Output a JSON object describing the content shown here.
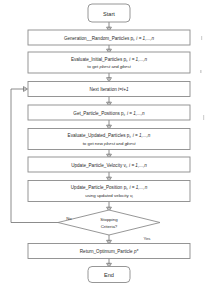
{
  "diagram": {
    "type": "flowchart",
    "orientation": "top-to-bottom",
    "colors": {
      "node_fill": "#ffffff",
      "node_stroke": "#8b8b8b",
      "line": "#6f6f6f",
      "text": "#2b2b2b",
      "background": "#ffffff"
    },
    "nodes": [
      {
        "id": "start",
        "shape": "terminator",
        "label": "Start",
        "line1": "Start",
        "line2": ""
      },
      {
        "id": "generate",
        "shape": "process",
        "label": "Generation__Random_Particles p, i = 1,...,n",
        "line1": "Generation__Random_Particles p",
        "line1_sub": "i",
        "line1_tail": ", i = 1,...,n",
        "line2": ""
      },
      {
        "id": "evaluate-initial",
        "shape": "process",
        "label": "Evaluate_Initial_Particles p, i = 1,...,n to get pbest and gbest",
        "line1": "Evaluate_Initial_Particles p",
        "line1_sub": "i",
        "line1_tail": ", i = 1,...,n",
        "line2_a": "to get ",
        "line2_b": "pbest",
        "line2_c": " and ",
        "line2_d": "gbest"
      },
      {
        "id": "next-iteration",
        "shape": "process",
        "label": "Next Iteration t=t+1",
        "line1": "Next Iteration ",
        "line1_tail": "t=t+1",
        "line2": ""
      },
      {
        "id": "get-positions",
        "shape": "process",
        "label": "Get_Particle_Positions p, i = 1,...,n",
        "line1": "Get_Particle_Positions p",
        "line1_sub": "i",
        "line1_tail": ", i = 1,...,n",
        "line2": ""
      },
      {
        "id": "evaluate-updated",
        "shape": "process",
        "label": "Evaluate_Updated_Particles p, i = 1,...,n to get new pbest and gbest",
        "line1": "Evaluate_Updated_Particles p",
        "line1_sub": "i",
        "line1_tail": ", i = 1,...,n",
        "line2_a": "to get new ",
        "line2_b": "pbest",
        "line2_c": " and ",
        "line2_d": "gbest"
      },
      {
        "id": "update-velocity",
        "shape": "process",
        "label": "Update_Particle_Velocity v, i = 1,...,n",
        "line1": "Update_Particle_Velocity v",
        "line1_sub": "i",
        "line1_tail": ", i = 1,...,n",
        "line2": ""
      },
      {
        "id": "update-position",
        "shape": "process",
        "label": "Update_Particle_Position p, i = 1,...,n using updated velocity v",
        "line1": "Update_Particle_Position p",
        "line1_sub": "i",
        "line1_tail": ", i = 1,...,n",
        "line2_a": "using updated velocity ",
        "line2_b": "v",
        "line2_sub": "i"
      },
      {
        "id": "stopping-criteria",
        "shape": "decision",
        "label": "Stopping Criteria?",
        "line1": "Stopping",
        "line2": "Criteria?"
      },
      {
        "id": "return-optimum",
        "shape": "process",
        "label": "Return_Optimum_Particle p*",
        "line1": "Return_Optimum_Particle ",
        "line1_tail": "p*",
        "line2": ""
      },
      {
        "id": "end",
        "shape": "terminator",
        "label": "End",
        "line1": "End",
        "line2": ""
      }
    ],
    "edge_labels": {
      "no": "No",
      "yes": "Yes"
    }
  }
}
